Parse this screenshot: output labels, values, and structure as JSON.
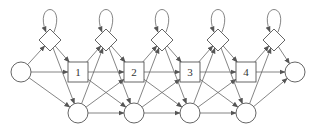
{
  "diagram": {
    "type": "state-transition-graph",
    "stroke_color": "#555555",
    "fill_color": "#ffffff",
    "nodes": {
      "start": {
        "shape": "circle",
        "label": ""
      },
      "end": {
        "shape": "circle",
        "label": ""
      },
      "boxes": [
        {
          "shape": "square",
          "label": "1"
        },
        {
          "shape": "square",
          "label": "2"
        },
        {
          "shape": "square",
          "label": "3"
        },
        {
          "shape": "square",
          "label": "4"
        }
      ],
      "diamonds_count": 5,
      "bottom_circles_count": 4
    }
  }
}
